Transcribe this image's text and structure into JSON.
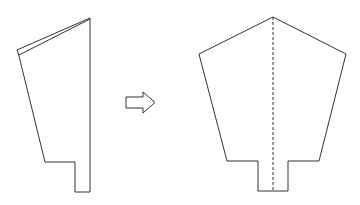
{
  "diagram": {
    "title": "",
    "stroke_color": "#333333",
    "background": "#ffffff",
    "folded_shape": {
      "label": "",
      "outer_points": "90,18 17,50 19,56 45,162 75,162 75,192 90,192",
      "back_flap_points": "90,18 17,50",
      "inner_flap_points": "90,19 19,55"
    },
    "arrow": {
      "label": "",
      "direction": "right",
      "points": "126,97 143,97 143,92 155,102.5 143,113 143,108 126,108"
    },
    "unfolded_shape": {
      "label": "",
      "outline_points": "273,17 199,54 227,161 258,161 258,191 288,191 288,161 319,161 346,54",
      "fold_line": {
        "x1": 273,
        "y1": 17,
        "x2": 273,
        "y2": 191,
        "style": "dashed"
      }
    }
  }
}
